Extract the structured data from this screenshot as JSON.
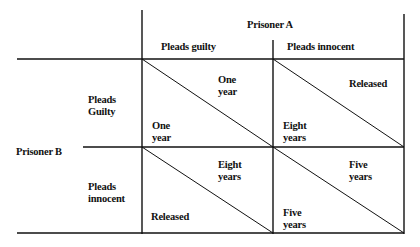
{
  "column_player": {
    "label": "Prisoner A",
    "options": [
      "Pleads guilty",
      "Pleads innocent"
    ]
  },
  "row_player": {
    "label": "Prisoner B",
    "options": [
      {
        "line1": "Pleads",
        "line2": "Guilty"
      },
      {
        "line1": "Pleads",
        "line2": "innocent"
      }
    ]
  },
  "cells": [
    {
      "row": "Pleads Guilty",
      "col": "Pleads guilty",
      "a_outcome": {
        "line1": "One",
        "line2": "year"
      },
      "b_outcome": {
        "line1": "One",
        "line2": "year"
      }
    },
    {
      "row": "Pleads Guilty",
      "col": "Pleads innocent",
      "a_outcome": {
        "line1": "Released",
        "line2": ""
      },
      "b_outcome": {
        "line1": "Eight",
        "line2": "years"
      }
    },
    {
      "row": "Pleads innocent",
      "col": "Pleads guilty",
      "a_outcome": {
        "line1": "Eight",
        "line2": "years"
      },
      "b_outcome": {
        "line1": "Released",
        "line2": ""
      }
    },
    {
      "row": "Pleads innocent",
      "col": "Pleads innocent",
      "a_outcome": {
        "line1": "Five",
        "line2": "years"
      },
      "b_outcome": {
        "line1": "Five",
        "line2": "years"
      }
    }
  ],
  "colors": {
    "line": "#111111",
    "background": "#ffffff"
  }
}
